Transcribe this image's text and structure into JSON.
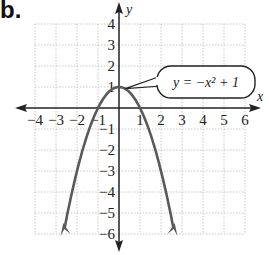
{
  "panel_label": "b.",
  "chart_data": {
    "type": "line",
    "title": "",
    "equation_label": "y = −x² + 1",
    "xlabel": "x",
    "ylabel": "y",
    "xlim": [
      -4,
      6
    ],
    "ylim": [
      -6,
      4
    ],
    "grid": true,
    "x_ticks": [
      "-4",
      "-3",
      "-2",
      "-1",
      "1",
      "2",
      "3",
      "4",
      "5",
      "6"
    ],
    "y_ticks": [
      "4",
      "3",
      "2",
      "1",
      "-1",
      "-2",
      "-3",
      "-4",
      "-5",
      "-6"
    ],
    "series": [
      {
        "name": "y = -x^2 + 1",
        "function": "-x^2+1",
        "x_range": [
          -2.6,
          2.6
        ],
        "vertex": [
          0,
          1
        ],
        "x_intercepts": [
          -1,
          1
        ],
        "arrows_at_ends": true
      }
    ]
  },
  "colors": {
    "curve": "#5a5a5a",
    "axis": "#222222",
    "grid": "#c8c8c8",
    "text": "#222222"
  }
}
